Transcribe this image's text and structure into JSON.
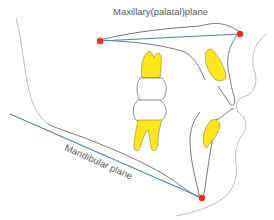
{
  "diagram": {
    "labels": {
      "maxillary_plane": "Maxillary(palatal)plane",
      "mandibular_plane": "Mandibular plane"
    },
    "landmarks": [
      {
        "name": "posterior-nasal-spine",
        "role": "maxillary plane posterior point"
      },
      {
        "name": "anterior-nasal-spine",
        "role": "maxillary plane anterior point"
      },
      {
        "name": "menton",
        "role": "mandibular plane anterior point"
      }
    ],
    "colors": {
      "plane_line": "#4a7fc4",
      "landmark": "#ff2a14",
      "tooth_root": "#ffe51c",
      "outline": "#3a3f4a",
      "label_text": "#555a63"
    }
  }
}
